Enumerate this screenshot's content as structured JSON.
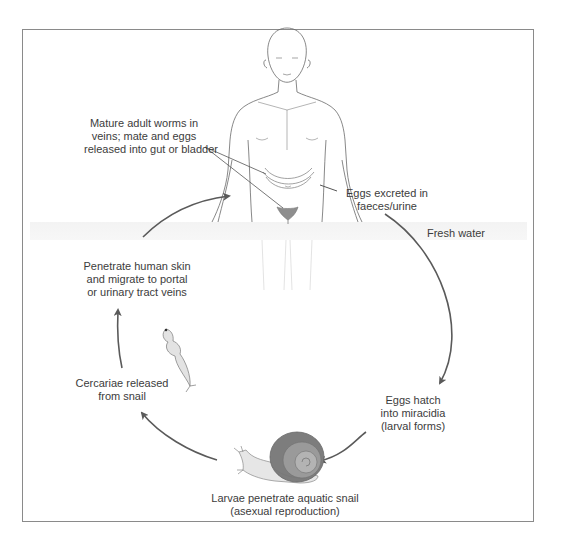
{
  "figure": {
    "stages": [
      {
        "id": "adult-worms",
        "lines": [
          "Mature adult worms in",
          "veins; mate and eggs",
          "released into gut or bladder"
        ]
      },
      {
        "id": "eggs-excreted",
        "lines": [
          "Eggs excreted in",
          "faeces/urine"
        ]
      },
      {
        "id": "fresh-water",
        "lines": [
          "Fresh water"
        ]
      },
      {
        "id": "eggs-hatch",
        "lines": [
          "Eggs hatch",
          "into miracidia",
          "(larval forms)"
        ]
      },
      {
        "id": "snail",
        "lines": [
          "Larvae penetrate aquatic snail",
          "(asexual reproduction)"
        ]
      },
      {
        "id": "cercariae",
        "lines": [
          "Cercariae released",
          "from snail"
        ]
      },
      {
        "id": "penetrate-skin",
        "lines": [
          "Penetrate human skin",
          "and migrate to portal",
          "or urinary tract veins"
        ]
      }
    ],
    "icons": [
      "human-body-icon",
      "intestine-icon",
      "bladder-icon",
      "snail-icon",
      "cercaria-icon"
    ],
    "colors": {
      "line": "#555555",
      "arrow": "#5a5a5a",
      "frame": "#8a8a8a",
      "snail_shell": "#7d7d7d",
      "snail_body": "#e6e6e6",
      "bladder": "#8e8e8e"
    }
  }
}
